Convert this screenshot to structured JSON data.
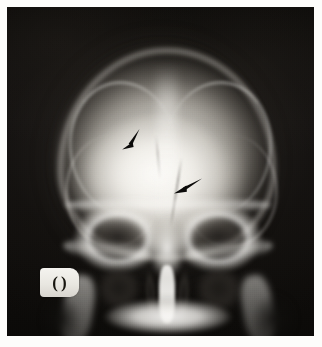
{
  "image": {
    "modality": "X-ray radiograph",
    "projection": "AP skull (Caldwell / occipitofrontal) view",
    "region": "Skull and facial bones",
    "background_color": "#0d0b09",
    "page_color": "#fdfdfb",
    "bone_color": "#f6f5f1"
  },
  "film": {
    "label": "radiographic film field"
  },
  "anatomy": {
    "vault": "cranial vault",
    "frontal_bone": "frontal bone",
    "sagittal_suture": "midline sagittal ridge",
    "orbit_left": "left orbit",
    "orbit_right": "right orbit",
    "nasal_septum": "nasal septum",
    "nasal_passage_left": "left nasal passage",
    "nasal_passage_right": "right nasal passage",
    "maxillary_sinus_left": "left maxillary sinus",
    "maxillary_sinus_right": "right maxillary sinus",
    "mandible": "mandible and maxilla",
    "petrous_left": "left petrous ridge",
    "petrous_right": "right petrous ridge",
    "fracture_line": "linear lucency (fracture line)"
  },
  "annotations": {
    "arrows": [
      {
        "id": "upper-arrow",
        "name": "annotation-arrow-upper",
        "x": 112,
        "y": 120,
        "rotation_deg": 200,
        "color": "#0b0a09",
        "points_to": "frontal bone lucency"
      },
      {
        "id": "lower-arrow",
        "name": "annotation-arrow-lower",
        "x": 166,
        "y": 170,
        "rotation_deg": 215,
        "color": "#0b0a09",
        "points_to": "linear fracture line"
      }
    ],
    "marker": {
      "name": "laterality-lead-marker",
      "glyph_left": "(",
      "glyph_right": ")",
      "plate_color": "#eeece6",
      "glyph_color": "#17150f"
    }
  }
}
